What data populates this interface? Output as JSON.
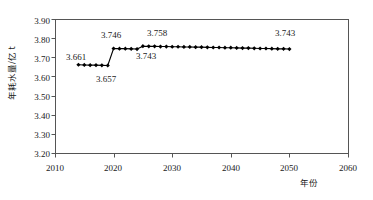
{
  "chart_data": {
    "type": "line",
    "title": "",
    "subtitle": "",
    "xlabel": "年份",
    "ylabel": "年耗水量/亿 t",
    "xlim": [
      2010,
      2060
    ],
    "ylim": [
      3.2,
      3.9
    ],
    "xticks": [
      2010,
      2020,
      2030,
      2040,
      2050,
      2060
    ],
    "xtick_labels": [
      "2010",
      "2020",
      "2030",
      "2040",
      "2050",
      "2060"
    ],
    "yticks": [
      3.2,
      3.3,
      3.4,
      3.5,
      3.6,
      3.7,
      3.8,
      3.9
    ],
    "ytick_labels": [
      "3.20",
      "3.30",
      "3.40",
      "3.50",
      "3.60",
      "3.70",
      "3.80",
      "3.90"
    ],
    "grid": false,
    "legend": null,
    "legend_position": "none",
    "marker": "diamond",
    "line_color": "#000000",
    "marker_color": "#000000",
    "series": [
      {
        "name": "年耗水量",
        "x": [
          2014,
          2015,
          2016,
          2017,
          2018,
          2019,
          2020,
          2021,
          2022,
          2023,
          2024,
          2025,
          2026,
          2027,
          2028,
          2029,
          2030,
          2031,
          2032,
          2033,
          2034,
          2035,
          2036,
          2037,
          2038,
          2039,
          2040,
          2041,
          2042,
          2043,
          2044,
          2045,
          2046,
          2047,
          2048,
          2049,
          2050
        ],
        "values": [
          3.661,
          3.66,
          3.659,
          3.659,
          3.658,
          3.657,
          3.746,
          3.745,
          3.745,
          3.744,
          3.743,
          3.758,
          3.757,
          3.757,
          3.756,
          3.756,
          3.755,
          3.755,
          3.754,
          3.754,
          3.753,
          3.753,
          3.752,
          3.751,
          3.751,
          3.75,
          3.75,
          3.749,
          3.748,
          3.748,
          3.747,
          3.746,
          3.746,
          3.745,
          3.744,
          3.744,
          3.743
        ]
      }
    ],
    "annotations": [
      {
        "text": "3.661",
        "x": 2014,
        "y": 3.661,
        "placement": "left"
      },
      {
        "text": "3.657",
        "x": 2019,
        "y": 3.657,
        "placement": "below"
      },
      {
        "text": "3.746",
        "x": 2020,
        "y": 3.746,
        "placement": "above-left"
      },
      {
        "text": "3.743",
        "x": 2024,
        "y": 3.743,
        "placement": "below"
      },
      {
        "text": "3.758",
        "x": 2026,
        "y": 3.758,
        "placement": "above"
      },
      {
        "text": "3.743",
        "x": 2050,
        "y": 3.743,
        "placement": "above"
      }
    ]
  },
  "axes": {
    "y_title": "年耗水量/亿 t",
    "x_title": "年份",
    "y_labels": [
      "3.90",
      "3.80",
      "3.70",
      "3.60",
      "3.50",
      "3.40",
      "3.30",
      "3.20"
    ],
    "x_labels": [
      "2010",
      "2020",
      "2030",
      "2040",
      "2050",
      "2060"
    ]
  },
  "annotations": {
    "a0": "3.661",
    "a1": "3.657",
    "a2": "3.746",
    "a3": "3.743",
    "a4": "3.758",
    "a5": "3.743"
  },
  "colors": {
    "axis": "#555555",
    "series": "#000000",
    "background": "#ffffff"
  }
}
